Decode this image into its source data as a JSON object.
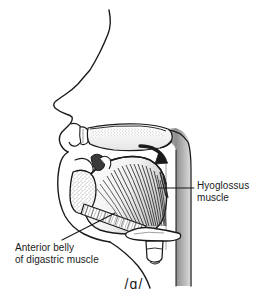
{
  "figure": {
    "type": "sagittal-anatomical-diagram",
    "phonetic_symbol": "/ɑ/",
    "background_color": "#ffffff",
    "line_color": "#1a1a1a",
    "shading_color": "#9a9a9a"
  },
  "labels": {
    "hyoglossus": {
      "line1": "Hyoglossus",
      "line2": "muscle"
    },
    "digastric": {
      "line1": "Anterior belly",
      "line2": "of digastric muscle"
    }
  },
  "structures": {
    "face_profile": "facial profile outline",
    "hard_palate": "hard palate stippled",
    "upper_lip": "upper lip",
    "upper_teeth": "upper teeth",
    "soft_palate": "soft palate and uvula",
    "tongue": "tongue body",
    "mandible": "mandible cross-section stippled",
    "hyoid_bone": "hyoid bone",
    "epiglottis": "epiglottis",
    "larynx": "larynx",
    "pharyngeal_wall": "posterior pharyngeal wall shaded",
    "hyoglossus_fibers": "hyoglossus muscle fibers",
    "digastric_fibers": "anterior belly of digastric muscle fibers",
    "motion_arrow": "tongue retraction arrow"
  }
}
